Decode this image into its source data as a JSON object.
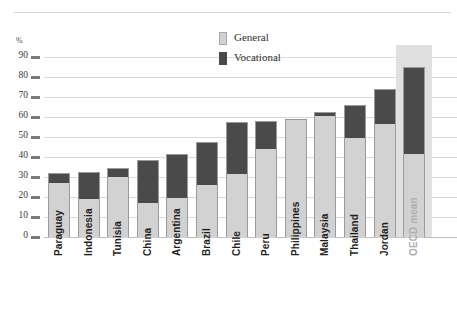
{
  "chart_data": {
    "type": "bar",
    "stacked": true,
    "title": "",
    "xlabel": "",
    "ylabel": "%",
    "ylim": [
      0,
      90
    ],
    "ytick_step": 10,
    "yticks": [
      "90",
      "80",
      "70",
      "60",
      "50",
      "40",
      "30",
      "20",
      "10",
      "0"
    ],
    "grid": true,
    "legend_position": "top-center",
    "categories": [
      "Paraguay",
      "Indonesia",
      "Tunisia",
      "China",
      "Argentina",
      "Brazil",
      "Chile",
      "Peru",
      "Philippines",
      "Malaysia",
      "Thailand",
      "Jordan",
      "OECD mean"
    ],
    "highlighted_category": "OECD mean",
    "series": [
      {
        "name": "General",
        "color": "#d2d2d2",
        "values": [
          27.5,
          19.5,
          30.5,
          17.5,
          20,
          26.5,
          32,
          44.5,
          59,
          61,
          50,
          57,
          42
        ]
      },
      {
        "name": "Vocational",
        "color": "#4a4a4a",
        "values": [
          4.5,
          13,
          4,
          21,
          21.5,
          21,
          25.5,
          13.5,
          0,
          1.5,
          16,
          17,
          43
        ]
      }
    ],
    "totals": [
      32,
      32.5,
      34.5,
      38.5,
      41.5,
      47.5,
      57.5,
      58,
      59,
      62.5,
      66,
      74,
      85
    ]
  },
  "legend": {
    "items": [
      {
        "label": "General",
        "color": "#d2d2d2"
      },
      {
        "label": "Vocational",
        "color": "#4a4a4a"
      }
    ]
  },
  "axis": {
    "unit_label": "%"
  }
}
